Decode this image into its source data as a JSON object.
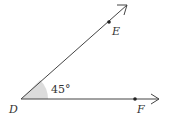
{
  "diagram": {
    "type": "angle",
    "vertex": {
      "label": "D",
      "x": 21,
      "y": 99
    },
    "ray_de": {
      "point_label": "E",
      "point": {
        "x": 109,
        "y": 22
      },
      "end": {
        "x": 127,
        "y": 5
      }
    },
    "ray_df": {
      "point_label": "F",
      "point": {
        "x": 135,
        "y": 99
      },
      "end": {
        "x": 159,
        "y": 99
      }
    },
    "angle_label": "45°",
    "angle_degrees": 45,
    "colors": {
      "line": "#444444",
      "wedge": "#dcdcdc",
      "text": "#333333"
    }
  }
}
